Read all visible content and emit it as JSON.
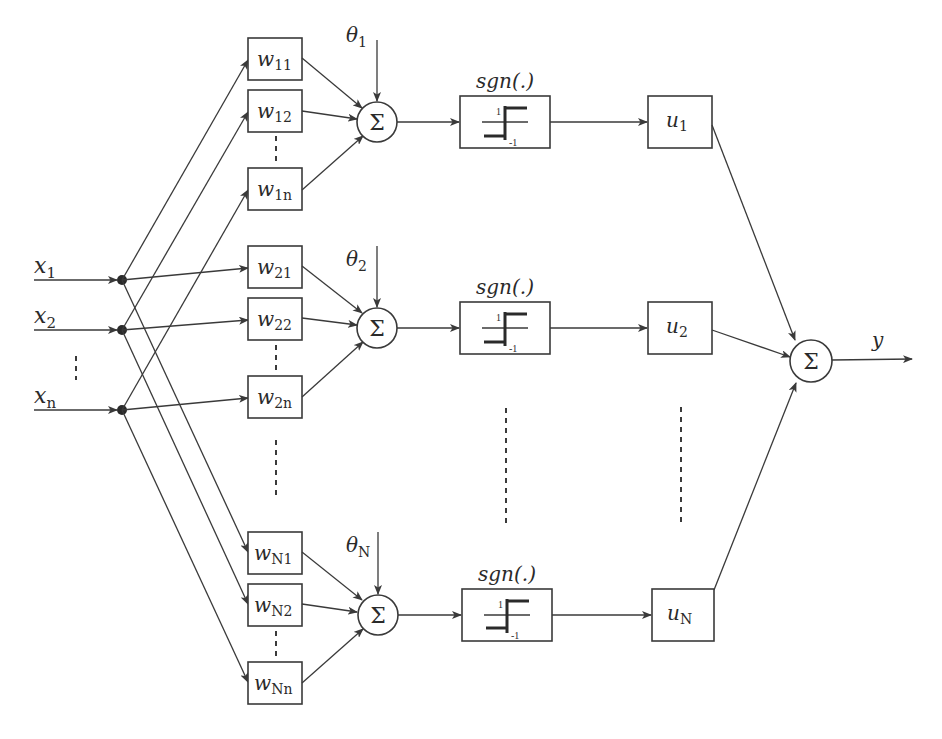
{
  "diagram": {
    "type": "neural-network-block-diagram",
    "inputs": [
      {
        "symbol": "x",
        "sub": "1"
      },
      {
        "symbol": "x",
        "sub": "2"
      },
      {
        "symbol": "x",
        "sub": "n"
      }
    ],
    "input_ellipsis": "⋮",
    "rows": [
      {
        "threshold": {
          "symbol": "θ",
          "sub": "1"
        },
        "weights": [
          {
            "symbol": "w",
            "sub": "11"
          },
          {
            "symbol": "w",
            "sub": "12"
          },
          {
            "symbol": "w",
            "sub": "1n"
          }
        ],
        "sum_symbol": "Σ",
        "activation_label": "sgn(.)",
        "activation_high": "1",
        "activation_low": "-1",
        "output_weight": {
          "symbol": "u",
          "sub": "1"
        }
      },
      {
        "threshold": {
          "symbol": "θ",
          "sub": "2"
        },
        "weights": [
          {
            "symbol": "w",
            "sub": "21"
          },
          {
            "symbol": "w",
            "sub": "22"
          },
          {
            "symbol": "w",
            "sub": "2n"
          }
        ],
        "sum_symbol": "Σ",
        "activation_label": "sgn(.)",
        "activation_high": "1",
        "activation_low": "-1",
        "output_weight": {
          "symbol": "u",
          "sub": "2"
        }
      },
      {
        "threshold": {
          "symbol": "θ",
          "sub": "N"
        },
        "weights": [
          {
            "symbol": "w",
            "sub": "N1"
          },
          {
            "symbol": "w",
            "sub": "N2"
          },
          {
            "symbol": "w",
            "sub": "Nn"
          }
        ],
        "sum_symbol": "Σ",
        "activation_label": "sgn(.)",
        "activation_high": "1",
        "activation_low": "-1",
        "output_weight": {
          "symbol": "u",
          "sub": "N"
        }
      }
    ],
    "output_sum_symbol": "Σ",
    "output": {
      "symbol": "y"
    },
    "colors": {
      "line": "#3a3a3a",
      "text": "#2a2a2a",
      "background": "#ffffff"
    }
  }
}
